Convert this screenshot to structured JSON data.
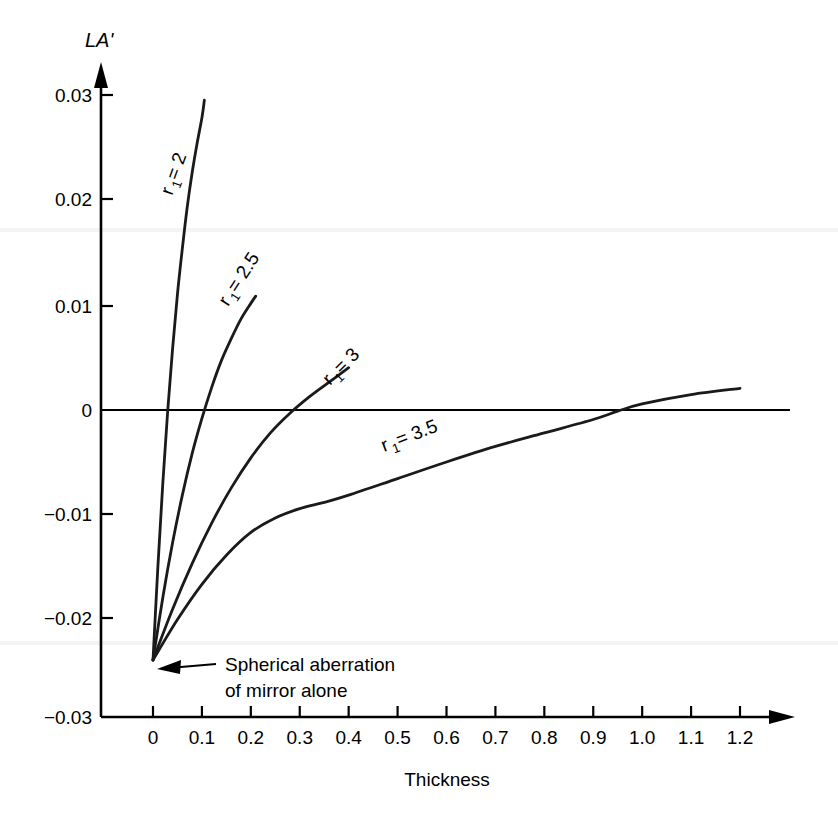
{
  "chart_data": {
    "type": "line",
    "title": "",
    "xlabel": "Thickness",
    "ylabel": "LA'",
    "xlim": [
      0,
      1.2
    ],
    "ylim": [
      -0.03,
      0.03
    ],
    "grid": false,
    "legend_position": "inline-curve-labels",
    "x_ticks": [
      "0",
      "0.1",
      "0.2",
      "0.3",
      "0.4",
      "0.5",
      "0.6",
      "0.7",
      "0.8",
      "0.9",
      "1.0",
      "1.1",
      "1.2"
    ],
    "x_tick_values": [
      0,
      0.1,
      0.2,
      0.3,
      0.4,
      0.5,
      0.6,
      0.7,
      0.8,
      0.9,
      1.0,
      1.1,
      1.2
    ],
    "y_ticks": [
      "0.03",
      "0.02",
      "0.01",
      "0",
      "−0.01",
      "−0.02",
      "−0.03"
    ],
    "y_tick_values": [
      0.03,
      0.02,
      0.01,
      0,
      -0.01,
      -0.02,
      -0.03
    ],
    "zero_reference_line": 0,
    "common_origin": {
      "x": 0,
      "y": -0.0245
    },
    "series": [
      {
        "name": "r1 = 2",
        "label": "r₁ = 2",
        "label_base": "r",
        "label_sub": "1",
        "label_rest": " = 2",
        "points": [
          [
            0.0,
            -0.0245
          ],
          [
            0.01,
            -0.0155
          ],
          [
            0.02,
            -0.0075
          ],
          [
            0.03,
            -0.0005
          ],
          [
            0.04,
            0.0055
          ],
          [
            0.05,
            0.0108
          ],
          [
            0.06,
            0.0152
          ],
          [
            0.07,
            0.0192
          ],
          [
            0.08,
            0.0225
          ],
          [
            0.09,
            0.0253
          ],
          [
            0.1,
            0.0278
          ],
          [
            0.105,
            0.0295
          ]
        ]
      },
      {
        "name": "r1 = 2.5",
        "label": "r₁ = 2.5",
        "label_base": "r",
        "label_sub": "1",
        "label_rest": " = 2.5",
        "points": [
          [
            0.0,
            -0.0245
          ],
          [
            0.02,
            -0.0185
          ],
          [
            0.04,
            -0.0132
          ],
          [
            0.06,
            -0.0086
          ],
          [
            0.08,
            -0.0046
          ],
          [
            0.1,
            -0.0012
          ],
          [
            0.12,
            0.0018
          ],
          [
            0.14,
            0.0044
          ],
          [
            0.16,
            0.0065
          ],
          [
            0.18,
            0.0084
          ],
          [
            0.2,
            0.0099
          ],
          [
            0.21,
            0.0106
          ]
        ]
      },
      {
        "name": "r1 = 3",
        "label": "r₁ = 3",
        "label_base": "r",
        "label_sub": "1",
        "label_rest": " = 3",
        "points": [
          [
            0.0,
            -0.0245
          ],
          [
            0.04,
            -0.0196
          ],
          [
            0.08,
            -0.0152
          ],
          [
            0.12,
            -0.0113
          ],
          [
            0.16,
            -0.0079
          ],
          [
            0.2,
            -0.005
          ],
          [
            0.24,
            -0.0026
          ],
          [
            0.28,
            -0.0007
          ],
          [
            0.32,
            0.0009
          ],
          [
            0.36,
            0.0023
          ],
          [
            0.4,
            0.0037
          ]
        ]
      },
      {
        "name": "r1 = 3.5",
        "label": "r₁ = 3.5",
        "label_base": "r",
        "label_sub": "1",
        "label_rest": " = 3.5",
        "points": [
          [
            0.0,
            -0.0245
          ],
          [
            0.05,
            -0.0206
          ],
          [
            0.1,
            -0.0172
          ],
          [
            0.15,
            -0.0144
          ],
          [
            0.2,
            -0.0122
          ],
          [
            0.25,
            -0.0108
          ],
          [
            0.3,
            -0.0099
          ],
          [
            0.35,
            -0.0093
          ],
          [
            0.4,
            -0.0086
          ],
          [
            0.5,
            -0.007
          ],
          [
            0.6,
            -0.0054
          ],
          [
            0.7,
            -0.0039
          ],
          [
            0.8,
            -0.0026
          ],
          [
            0.9,
            -0.0013
          ],
          [
            0.95,
            -0.0005
          ],
          [
            1.0,
            0.0002
          ],
          [
            1.1,
            0.0011
          ],
          [
            1.2,
            0.0017
          ]
        ]
      }
    ],
    "annotations": [
      {
        "name": "spherical-aberration-note",
        "line1": "Spherical aberration",
        "line2": "of mirror alone",
        "points_to": {
          "x": 0,
          "y": -0.0245
        }
      }
    ]
  }
}
